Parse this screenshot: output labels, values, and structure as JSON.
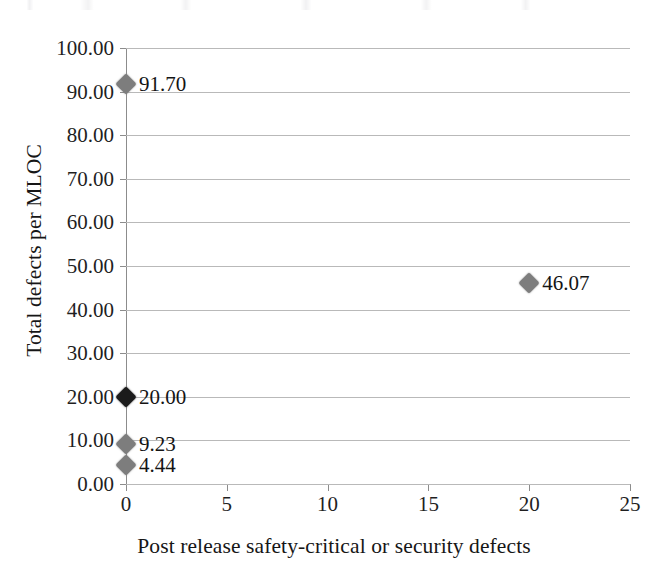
{
  "chart_data": {
    "type": "scatter",
    "title": "",
    "xlabel": "Post release safety-critical or security defects",
    "ylabel": "Total defects per MLOC",
    "xlim": [
      0,
      25
    ],
    "ylim": [
      0,
      100
    ],
    "xticks": [
      "0",
      "5",
      "10",
      "15",
      "20",
      "25"
    ],
    "xtick_values": [
      0,
      5,
      10,
      15,
      20,
      25
    ],
    "yticks": [
      "0.00",
      "10.00",
      "20.00",
      "30.00",
      "40.00",
      "50.00",
      "60.00",
      "70.00",
      "80.00",
      "90.00",
      "100.00"
    ],
    "ytick_values": [
      0,
      10,
      20,
      30,
      40,
      50,
      60,
      70,
      80,
      90,
      100
    ],
    "grid": "horizontal",
    "legend": "none",
    "marker": "diamond",
    "points": [
      {
        "x": 0,
        "y": 91.7,
        "label": "91.70",
        "color": "#7d7d7d",
        "label_side": "right"
      },
      {
        "x": 20,
        "y": 46.07,
        "label": "46.07",
        "color": "#7d7d7d",
        "label_side": "right"
      },
      {
        "x": 0,
        "y": 20.0,
        "label": "20.00",
        "color": "#1b1b1b",
        "label_side": "right"
      },
      {
        "x": 0,
        "y": 9.23,
        "label": "9.23",
        "color": "#7d7d7d",
        "label_side": "right"
      },
      {
        "x": 0,
        "y": 4.44,
        "label": "4.44",
        "color": "#7d7d7d",
        "label_side": "right"
      }
    ]
  },
  "colors": {
    "marker_gray": "#7d7d7d",
    "marker_dark": "#1b1b1b",
    "gridline": "#b9b9b9",
    "axis": "#8c8c8c",
    "text": "#1a1a1a",
    "background": "#ffffff"
  }
}
